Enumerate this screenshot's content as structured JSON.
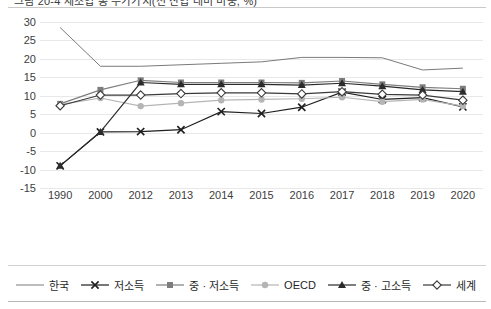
{
  "caption": {
    "text": "그림 20-4   제조업 총 부가가치(전 산업 대비 비중, %)"
  },
  "chart_data": {
    "type": "line",
    "title": "",
    "xlabel": "",
    "ylabel": "",
    "ylim": [
      -15,
      30
    ],
    "yticks": [
      30,
      25,
      20,
      15,
      10,
      5,
      0,
      -5,
      -10,
      -15
    ],
    "ytick_labels": [
      "30",
      "25",
      "20",
      "15",
      "10",
      "5",
      "0",
      "-5",
      "-10",
      "-15"
    ],
    "grid": true,
    "legend_position": "bottom",
    "categories": [
      "1990",
      "2000",
      "2012",
      "2013",
      "2014",
      "2015",
      "2016",
      "2017",
      "2018",
      "2019",
      "2020"
    ],
    "series": [
      {
        "name": "한국",
        "marker": "none",
        "color": "#7a7a7a",
        "values": [
          28.5,
          18.0,
          18.0,
          18.4,
          18.8,
          19.2,
          20.4,
          20.4,
          20.3,
          17.0,
          17.5
        ]
      },
      {
        "name": "저소득",
        "marker": "x",
        "color": "#1f1f1f",
        "values": [
          -9.0,
          0.2,
          0.3,
          0.8,
          5.7,
          5.2,
          6.9,
          11.0,
          9.0,
          9.5,
          7.0
        ]
      },
      {
        "name": "중 · 저소득",
        "marker": "square",
        "color": "#7d7d7d",
        "values": [
          7.8,
          11.6,
          14.2,
          13.6,
          13.6,
          13.6,
          13.5,
          14.0,
          13.1,
          12.3,
          11.9
        ]
      },
      {
        "name": "OECD",
        "marker": "circle",
        "color": "#b5b5b5",
        "values": [
          7.6,
          9.4,
          7.2,
          8.0,
          8.8,
          9.0,
          9.2,
          9.6,
          8.4,
          9.0,
          7.2
        ]
      },
      {
        "name": "중 · 고소득",
        "marker": "triangle",
        "color": "#2b2b2b",
        "values": [
          -9.0,
          0.2,
          13.6,
          13.1,
          13.1,
          13.1,
          12.9,
          13.4,
          12.6,
          11.6,
          11.1
        ]
      },
      {
        "name": "세계",
        "marker": "diamond",
        "color": "#3a3a3a",
        "values": [
          7.3,
          10.2,
          10.2,
          10.6,
          10.8,
          10.8,
          10.5,
          11.1,
          10.4,
          10.2,
          8.8
        ]
      }
    ]
  }
}
